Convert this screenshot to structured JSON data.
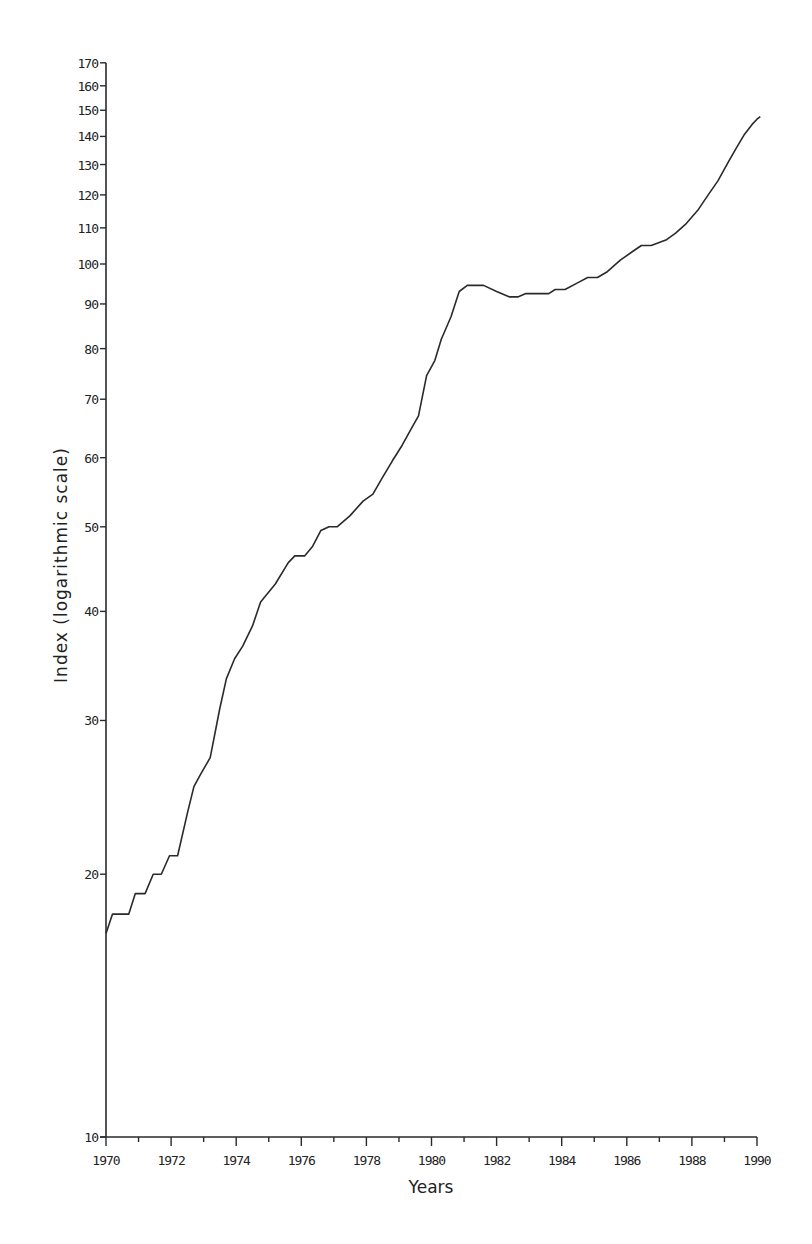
{
  "chart_data": {
    "type": "line",
    "title": "",
    "xlabel": "Years",
    "ylabel": "Index (logarithmic scale)",
    "yscale": "log",
    "xlim": [
      1970,
      1990
    ],
    "ylim": [
      10,
      170
    ],
    "grid": false,
    "legend": null,
    "x_ticks": [
      1970,
      1972,
      1974,
      1976,
      1978,
      1980,
      1982,
      1984,
      1986,
      1988,
      1990
    ],
    "x_minor_ticks": [
      1971,
      1973,
      1975,
      1977,
      1979,
      1981,
      1983,
      1985,
      1987,
      1989
    ],
    "y_ticks": [
      10,
      20,
      30,
      40,
      50,
      60,
      70,
      80,
      90,
      100,
      110,
      120,
      130,
      140,
      150,
      160,
      170
    ],
    "series": [
      {
        "name": "Index",
        "color": "#2a2a2a",
        "points": [
          [
            1970.0,
            17.1
          ],
          [
            1970.2,
            18.0
          ],
          [
            1970.7,
            18.0
          ],
          [
            1970.9,
            19.0
          ],
          [
            1971.2,
            19.0
          ],
          [
            1971.45,
            20.0
          ],
          [
            1971.7,
            20.0
          ],
          [
            1971.95,
            21.0
          ],
          [
            1972.2,
            21.0
          ],
          [
            1972.5,
            23.5
          ],
          [
            1972.7,
            25.2
          ],
          [
            1972.9,
            26.0
          ],
          [
            1973.2,
            27.2
          ],
          [
            1973.5,
            31.0
          ],
          [
            1973.7,
            33.5
          ],
          [
            1973.95,
            35.3
          ],
          [
            1974.2,
            36.5
          ],
          [
            1974.5,
            38.5
          ],
          [
            1974.75,
            41.0
          ],
          [
            1975.2,
            43.0
          ],
          [
            1975.6,
            45.5
          ],
          [
            1975.8,
            46.3
          ],
          [
            1976.1,
            46.3
          ],
          [
            1976.35,
            47.5
          ],
          [
            1976.6,
            49.5
          ],
          [
            1976.85,
            50.0
          ],
          [
            1977.1,
            50.0
          ],
          [
            1977.5,
            51.5
          ],
          [
            1977.9,
            53.5
          ],
          [
            1978.2,
            54.5
          ],
          [
            1978.5,
            57.0
          ],
          [
            1978.8,
            59.5
          ],
          [
            1979.1,
            62.0
          ],
          [
            1979.4,
            65.0
          ],
          [
            1979.6,
            67.0
          ],
          [
            1979.85,
            74.5
          ],
          [
            1980.1,
            77.5
          ],
          [
            1980.3,
            82.0
          ],
          [
            1980.6,
            87.0
          ],
          [
            1980.85,
            93.0
          ],
          [
            1981.1,
            94.5
          ],
          [
            1981.6,
            94.5
          ],
          [
            1982.0,
            93.0
          ],
          [
            1982.4,
            91.7
          ],
          [
            1982.65,
            91.7
          ],
          [
            1982.9,
            92.5
          ],
          [
            1983.6,
            92.5
          ],
          [
            1983.8,
            93.5
          ],
          [
            1984.1,
            93.5
          ],
          [
            1984.5,
            95.2
          ],
          [
            1984.8,
            96.5
          ],
          [
            1985.1,
            96.5
          ],
          [
            1985.4,
            98.0
          ],
          [
            1985.8,
            101.0
          ],
          [
            1986.2,
            103.5
          ],
          [
            1986.45,
            105.0
          ],
          [
            1986.75,
            105.0
          ],
          [
            1987.2,
            106.5
          ],
          [
            1987.5,
            108.5
          ],
          [
            1987.8,
            111.0
          ],
          [
            1988.2,
            115.5
          ],
          [
            1988.5,
            120.0
          ],
          [
            1988.8,
            124.5
          ],
          [
            1989.1,
            130.5
          ],
          [
            1989.35,
            135.5
          ],
          [
            1989.6,
            140.5
          ],
          [
            1989.85,
            144.5
          ],
          [
            1990.0,
            146.5
          ],
          [
            1990.1,
            147.5
          ]
        ]
      }
    ]
  }
}
